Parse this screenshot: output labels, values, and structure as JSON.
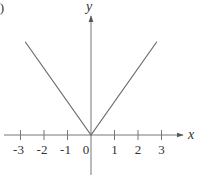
{
  "figure": {
    "panel_label": "a)"
  },
  "chart_data": {
    "type": "line",
    "title": "",
    "function": "y = |x|",
    "xlabel": "x",
    "ylabel": "y",
    "xlim": [
      -3.9,
      4.0
    ],
    "ylim": [
      -1.2,
      3.6
    ],
    "grid": false,
    "legend": null,
    "x_ticks": [
      -3,
      -2,
      -1,
      0,
      1,
      2,
      3
    ],
    "x_tick_labels": [
      "-3",
      "-2",
      "-1",
      "0",
      "1",
      "2",
      "3"
    ],
    "y_ticks": [],
    "series": [
      {
        "name": "y = |x|",
        "color": "#6b6b6b",
        "x": [
          -2.8,
          0,
          2.8
        ],
        "y": [
          2.8,
          0,
          2.8
        ]
      }
    ]
  }
}
